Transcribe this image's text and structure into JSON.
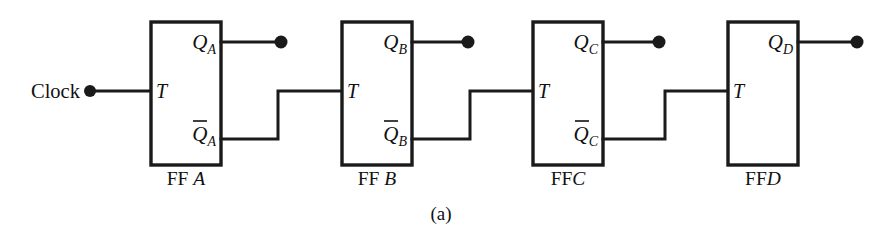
{
  "figure": {
    "caption": "(a)",
    "kind": "circuit-diagram",
    "ink_color": "#1a1a1a",
    "background_color": "#ffffff"
  },
  "clock": {
    "label": "Clock",
    "terminal": "input-dot"
  },
  "flipflops": [
    {
      "name_prefix": "FF",
      "name_suffix": "A",
      "name_full": "FF A",
      "clock_input_label": "T",
      "q_label": "Q",
      "q_subscript": "A",
      "qbar_label": "Q",
      "qbar_subscript": "A",
      "qbar_overbar": true,
      "q_output_terminal": "output-dot",
      "has_qbar": true
    },
    {
      "name_prefix": "FF",
      "name_suffix": "B",
      "name_full": "FF B",
      "clock_input_label": "T",
      "q_label": "Q",
      "q_subscript": "B",
      "qbar_label": "Q",
      "qbar_subscript": "B",
      "qbar_overbar": true,
      "q_output_terminal": "output-dot",
      "has_qbar": true
    },
    {
      "name_prefix": "FF",
      "name_suffix": "C",
      "name_full": "FFC",
      "clock_input_label": "T",
      "q_label": "Q",
      "q_subscript": "C",
      "qbar_label": "Q",
      "qbar_subscript": "C",
      "qbar_overbar": true,
      "q_output_terminal": "output-dot",
      "has_qbar": true
    },
    {
      "name_prefix": "FF",
      "name_suffix": "D",
      "name_full": "FFD",
      "clock_input_label": "T",
      "q_label": "Q",
      "q_subscript": "D",
      "qbar_label": "",
      "qbar_subscript": "",
      "qbar_overbar": false,
      "q_output_terminal": "output-dot",
      "has_qbar": false
    }
  ]
}
